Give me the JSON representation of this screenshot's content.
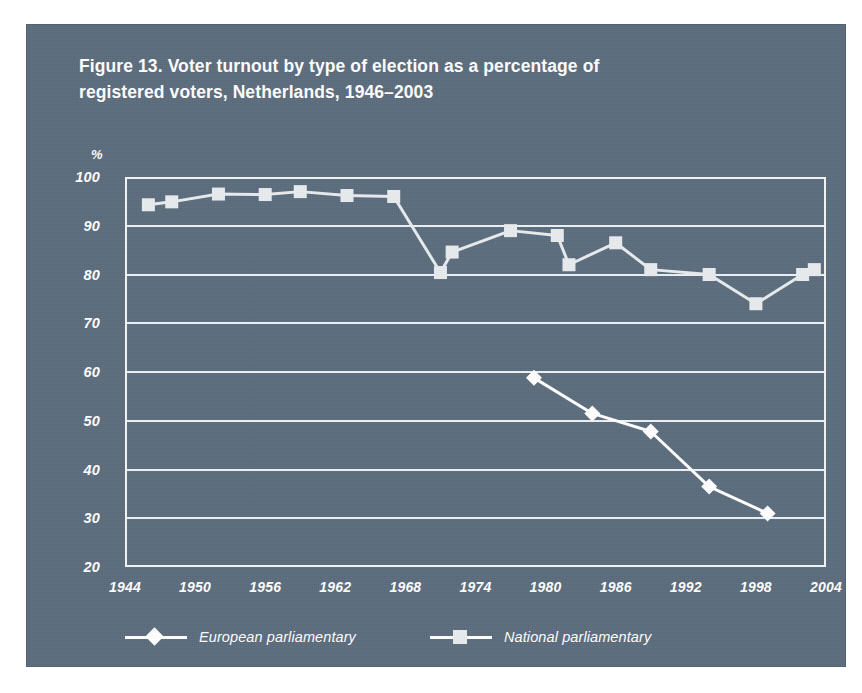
{
  "figure": {
    "title": "Figure 13. Voter turnout by type of election as a percentage of registered voters, Netherlands, 1946–2003",
    "panel_color": "#5b6c7d",
    "ink_color": "#ffffff"
  },
  "chart_data": {
    "type": "line",
    "title": "Figure 13. Voter turnout by type of election as a percentage of registered voters, Netherlands, 1946–2003",
    "xlabel": "",
    "ylabel": "%",
    "y_unit_label": "%",
    "xlim": [
      1944,
      2004
    ],
    "ylim": [
      20,
      100
    ],
    "yticks": [
      20,
      30,
      40,
      50,
      60,
      70,
      80,
      90,
      100
    ],
    "ytick_labels": [
      "20",
      "30",
      "40",
      "50",
      "60",
      "70",
      "80",
      "90",
      "100"
    ],
    "xticks": [
      1944,
      1950,
      1956,
      1962,
      1968,
      1974,
      1980,
      1986,
      1992,
      1998,
      2004
    ],
    "xtick_labels": [
      "1944",
      "1950",
      "1956",
      "1962",
      "1968",
      "1974",
      "1980",
      "1986",
      "1992",
      "1998",
      "2004"
    ],
    "grid": true,
    "grid_axis": "y",
    "legend_position": "bottom",
    "series": [
      {
        "name": "European parliamentary",
        "marker": "diamond",
        "color": "#ffffff",
        "points": [
          {
            "x": 1979,
            "y": 58.8
          },
          {
            "x": 1984,
            "y": 51.5
          },
          {
            "x": 1989,
            "y": 47.8
          },
          {
            "x": 1994,
            "y": 36.5
          },
          {
            "x": 1999,
            "y": 31.0
          }
        ]
      },
      {
        "name": "National parliamentary",
        "marker": "square",
        "color": "#e9ecef",
        "points": [
          {
            "x": 1946,
            "y": 94.3
          },
          {
            "x": 1948,
            "y": 94.9
          },
          {
            "x": 1952,
            "y": 96.5
          },
          {
            "x": 1956,
            "y": 96.4
          },
          {
            "x": 1959,
            "y": 97.0
          },
          {
            "x": 1963,
            "y": 96.2
          },
          {
            "x": 1967,
            "y": 96.0
          },
          {
            "x": 1971,
            "y": 80.4
          },
          {
            "x": 1972,
            "y": 84.6
          },
          {
            "x": 1977,
            "y": 89.0
          },
          {
            "x": 1981,
            "y": 88.0
          },
          {
            "x": 1982,
            "y": 82.0
          },
          {
            "x": 1986,
            "y": 86.5
          },
          {
            "x": 1989,
            "y": 81.0
          },
          {
            "x": 1994,
            "y": 80.0
          },
          {
            "x": 1998,
            "y": 74.0
          },
          {
            "x": 2002,
            "y": 80.0
          },
          {
            "x": 2003,
            "y": 81.0
          }
        ]
      }
    ]
  },
  "legend": {
    "entries": [
      {
        "label": "European parliamentary",
        "marker": "diamond"
      },
      {
        "label": "National parliamentary",
        "marker": "square"
      }
    ]
  }
}
